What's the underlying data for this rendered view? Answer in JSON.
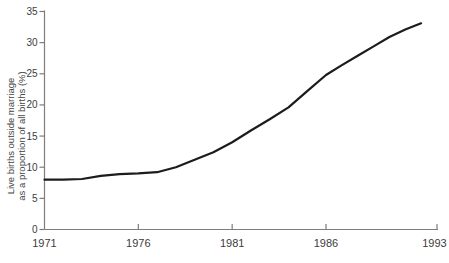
{
  "page": {
    "background_color": "#ffffff"
  },
  "chart_data": {
    "type": "line",
    "title": "",
    "xlabel": "",
    "ylabel_line1": "Live births outside marriage",
    "ylabel_line2": "as a proportion of all births (%)",
    "series": [
      {
        "name": "Live births outside marriage as a proportion of all births (%)",
        "x": [
          1971,
          1972,
          1973,
          1974,
          1975,
          1976,
          1977,
          1978,
          1979,
          1980,
          1981,
          1982,
          1983,
          1984,
          1985,
          1986,
          1987,
          1988,
          1989,
          1990,
          1991,
          1992
        ],
        "values": [
          8.0,
          8.0,
          8.1,
          8.6,
          8.9,
          9.0,
          9.2,
          10.0,
          11.2,
          12.4,
          14.0,
          15.9,
          17.7,
          19.6,
          22.2,
          24.8,
          26.4,
          27.9,
          29.4,
          30.9,
          32.1,
          33.1
        ]
      }
    ],
    "xlim": [
      1971,
      1993
    ],
    "ylim": [
      0,
      35
    ],
    "yticks": [
      0,
      5,
      10,
      15,
      20,
      25,
      30,
      35
    ],
    "ytick_labels": [
      "0",
      "5",
      "10",
      "15",
      "20",
      "25",
      "30",
      "35"
    ],
    "xtick_years": [
      1971,
      1976,
      1981,
      1986,
      1993
    ],
    "xtick_labels": [
      "1971",
      "1976",
      "1981",
      "1986",
      "1993"
    ],
    "grid": false,
    "legend": "none",
    "colors": {
      "line": "#1c1c1c",
      "axis": "#7d7d7d",
      "text": "#3c3c3c"
    }
  }
}
